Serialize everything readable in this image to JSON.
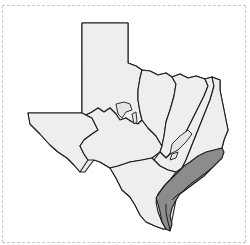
{
  "map": {
    "subject": "Texas",
    "description": "Outline map of Texas divided into regions, with the Gulf Coast region shaded dark gray",
    "colors": {
      "background": "#ffffff",
      "region_fill": "#eeeeee",
      "highlighted_region_fill": "#8c8c8c",
      "border": "#1c1c1c",
      "frame": "#c8c8c8"
    },
    "regions": [
      {
        "name": "panhandle",
        "highlighted": false
      },
      {
        "name": "trans-pecos",
        "highlighted": false
      },
      {
        "name": "edwards-plateau",
        "highlighted": false
      },
      {
        "name": "cross-timbers",
        "highlighted": false
      },
      {
        "name": "blackland-prairie",
        "highlighted": false
      },
      {
        "name": "post-oak-savannah",
        "highlighted": false
      },
      {
        "name": "piney-woods",
        "highlighted": false
      },
      {
        "name": "south-texas-plains",
        "highlighted": false
      },
      {
        "name": "gulf-coast",
        "highlighted": true
      }
    ]
  }
}
